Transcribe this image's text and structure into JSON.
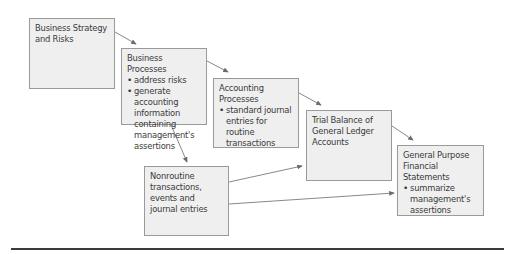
{
  "diagram": {
    "nodes": [
      {
        "id": "strategy",
        "title": "Business Strategy and Risks",
        "bullets": []
      },
      {
        "id": "business_processes",
        "title": "Business Processes",
        "bullets": [
          "address risks",
          "generate accounting information containing management's assertions"
        ]
      },
      {
        "id": "accounting_processes",
        "title": "Accounting Processes",
        "bullets": [
          "standard journal entries for routine transactions"
        ]
      },
      {
        "id": "trial_balance",
        "title": "Trial Balance of General Ledger Accounts",
        "bullets": []
      },
      {
        "id": "financial_statements",
        "title": "General Purpose Financial Statements",
        "bullets": [
          "summarize management's assertions"
        ]
      },
      {
        "id": "nonroutine",
        "title": "Nonroutine transactions, events and journal entries",
        "bullets": []
      }
    ],
    "edges": [
      {
        "from": "strategy",
        "to": "business_processes"
      },
      {
        "from": "business_processes",
        "to": "accounting_processes"
      },
      {
        "from": "business_processes",
        "to": "nonroutine"
      },
      {
        "from": "accounting_processes",
        "to": "trial_balance"
      },
      {
        "from": "trial_balance",
        "to": "financial_statements"
      },
      {
        "from": "nonroutine",
        "to": "trial_balance"
      },
      {
        "from": "nonroutine",
        "to": "financial_statements"
      }
    ],
    "colors": {
      "box_fill": "#efefef",
      "box_border": "#9a9a9a",
      "arrow": "#6a6a6a",
      "rule": "#3b3b3b"
    }
  }
}
